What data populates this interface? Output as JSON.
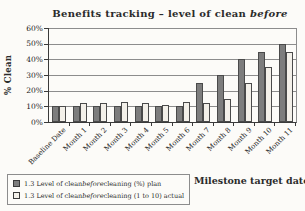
{
  "title": {
    "prefix": "Benefits tracking – level of clean ",
    "italic": "before"
  },
  "chart_data": {
    "type": "bar",
    "categories": [
      "Baseline Date",
      "Month 1",
      "Month 2",
      "Month 3",
      "Month 4",
      "Month 5",
      "Month 6",
      "Month 7",
      "Month 8",
      "Month 9",
      "Month 10",
      "Month 11"
    ],
    "series": [
      {
        "name": "1.3 Level of clean before cleaning (%) plan",
        "values": [
          10,
          10,
          10,
          10,
          10,
          10,
          10,
          25,
          30,
          40,
          45,
          50
        ],
        "color": "#7d7d7d"
      },
      {
        "name": "1.3 Level of clean before cleaning (1 to 10) actual",
        "values": [
          10,
          12,
          12,
          13,
          12,
          11,
          13,
          12,
          15,
          25,
          35,
          45
        ],
        "color": "#f3f0e9"
      }
    ],
    "title": "Benefits tracking – level of clean before",
    "ylabel": "% Clean",
    "xlabel": "Milestone target dates",
    "ylim": [
      0,
      60
    ],
    "ytick_step": 10,
    "ytick_labels": [
      "0%",
      "10%",
      "20%",
      "30%",
      "40%",
      "50%",
      "60%"
    ],
    "grid": true,
    "legend_position": "bottom-left"
  },
  "legend": {
    "items": [
      {
        "marker": "filled-square",
        "prefix": "1.3 Level of clean ",
        "italic": "before",
        "suffix": " cleaning (%) plan"
      },
      {
        "marker": "open-square",
        "prefix": "1.3 Level of clean ",
        "italic": "before",
        "suffix": " cleaning (1 to 10) actual"
      }
    ]
  },
  "colors": {
    "plan_bar": "#7d7d7d",
    "actual_bar": "#f3f0e9",
    "bar_border": "#4a4a4a",
    "gridline": "#8c8c8c",
    "axis": "#3a3a3a",
    "background": "#fcfbf8"
  }
}
